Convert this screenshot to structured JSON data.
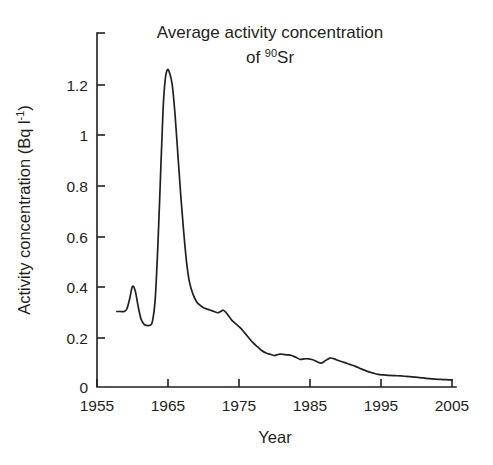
{
  "chart_data": {
    "type": "line",
    "title": "Average activity concentration of 90Sr",
    "title_line1": "Average activity concentration",
    "title_line2_prefix": "of ",
    "title_line2_sup": "90",
    "title_line2_suffix": "Sr",
    "xlabel": "Year",
    "ylabel": "Activity concentration (Bq l-1)",
    "ylabel_prefix": "Activity concentration (Bq l",
    "ylabel_sup": "-1",
    "ylabel_suffix": ")",
    "xlim": [
      1955,
      2005
    ],
    "ylim": [
      0,
      1.41
    ],
    "xticks": [
      1955,
      1965,
      1975,
      1985,
      1995,
      2005
    ],
    "xtick_labels": [
      "1955",
      "1965",
      "1975",
      "1985",
      "1995",
      "2005"
    ],
    "yticks": [
      0,
      0.2,
      0.4,
      0.6,
      0.8,
      1,
      1.2,
      1.4
    ],
    "ytick_labels": [
      "0",
      "0.2",
      "0.4",
      "0.6",
      "0.8",
      "1",
      "1.2",
      ""
    ],
    "grid": false,
    "legend": false,
    "line_color": "#231f20",
    "background": "#ffffff",
    "series": [
      {
        "name": "Average activity concentration of 90Sr",
        "x": [
          1957.8,
          1958.3,
          1958.8,
          1959.2,
          1959.6,
          1960.0,
          1960.4,
          1960.8,
          1961.2,
          1961.6,
          1962.0,
          1962.4,
          1962.8,
          1963.2,
          1963.6,
          1964.0,
          1964.3,
          1964.6,
          1964.9,
          1965.2,
          1965.6,
          1966.0,
          1966.4,
          1966.8,
          1967.2,
          1967.6,
          1968.0,
          1968.5,
          1969.0,
          1969.5,
          1970.0,
          1970.5,
          1971.0,
          1971.5,
          1972.0,
          1972.4,
          1972.8,
          1973.2,
          1973.6,
          1974.0,
          1974.6,
          1975.2,
          1975.8,
          1976.4,
          1977.0,
          1977.6,
          1978.2,
          1978.8,
          1979.4,
          1980.0,
          1980.6,
          1981.2,
          1981.8,
          1982.4,
          1983.0,
          1983.6,
          1984.2,
          1984.8,
          1985.4,
          1986.0,
          1986.6,
          1987.2,
          1987.8,
          1988.4,
          1989.0,
          1989.8,
          1990.6,
          1991.4,
          1992.2,
          1993.0,
          1993.8,
          1994.6,
          1995.4,
          1996.2,
          1997.0,
          1997.8,
          1998.6,
          1999.4,
          2000.2,
          2001.0,
          2001.8,
          2002.6,
          2003.4,
          2004.2,
          2005.0
        ],
        "y": [
          0.3,
          0.3,
          0.3,
          0.31,
          0.35,
          0.4,
          0.38,
          0.32,
          0.27,
          0.25,
          0.245,
          0.245,
          0.26,
          0.35,
          0.58,
          0.88,
          1.1,
          1.22,
          1.26,
          1.25,
          1.2,
          1.08,
          0.92,
          0.76,
          0.62,
          0.5,
          0.42,
          0.37,
          0.34,
          0.325,
          0.315,
          0.31,
          0.305,
          0.3,
          0.295,
          0.3,
          0.305,
          0.295,
          0.28,
          0.265,
          0.25,
          0.235,
          0.215,
          0.195,
          0.175,
          0.16,
          0.145,
          0.135,
          0.13,
          0.125,
          0.13,
          0.13,
          0.128,
          0.125,
          0.118,
          0.11,
          0.112,
          0.112,
          0.108,
          0.1,
          0.095,
          0.105,
          0.115,
          0.112,
          0.105,
          0.098,
          0.09,
          0.082,
          0.072,
          0.063,
          0.056,
          0.05,
          0.048,
          0.046,
          0.045,
          0.044,
          0.042,
          0.04,
          0.038,
          0.036,
          0.033,
          0.031,
          0.03,
          0.029,
          0.028
        ]
      }
    ]
  }
}
